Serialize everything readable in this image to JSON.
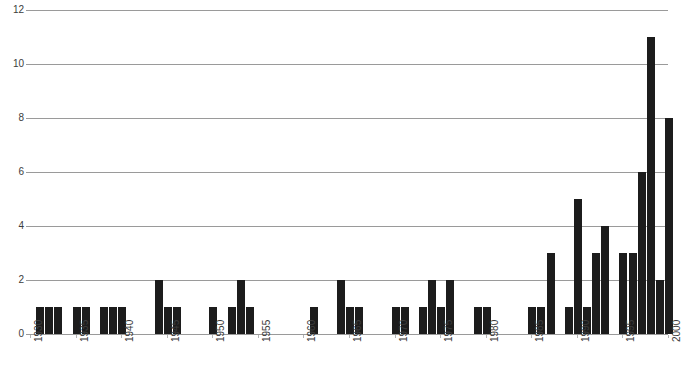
{
  "chart_data": {
    "type": "bar",
    "title": "",
    "subtitle": "",
    "xlabel": "",
    "ylabel": "",
    "grid": true,
    "legend": null,
    "ylim": [
      0,
      12
    ],
    "xlim": [
      1930,
      2000
    ],
    "y_ticks": [
      0,
      2,
      4,
      6,
      8,
      10,
      12
    ],
    "y_tick_labels": [
      "0",
      "2",
      "4",
      "6",
      "8",
      "10",
      "12"
    ],
    "x_ticks": [
      1930,
      1935,
      1940,
      1945,
      1950,
      1955,
      1960,
      1965,
      1970,
      1975,
      1980,
      1985,
      1990,
      1995,
      2000
    ],
    "x_tick_labels": [
      "1930",
      "1935",
      "1940",
      "1945",
      "1950",
      "1955",
      "1960",
      "1965",
      "1970",
      "1975",
      "1980",
      "1985",
      "1990",
      "1995",
      "2000"
    ],
    "bar_color": "#1c1c1c",
    "grid_color": "#9a9a9a",
    "categories": [
      1931,
      1932,
      1933,
      1935,
      1936,
      1938,
      1939,
      1940,
      1944,
      1945,
      1946,
      1950,
      1952,
      1953,
      1954,
      1961,
      1964,
      1965,
      1966,
      1970,
      1971,
      1973,
      1974,
      1975,
      1976,
      1979,
      1980,
      1985,
      1986,
      1987,
      1989,
      1990,
      1991,
      1992,
      1993,
      1995,
      1996,
      1997,
      1998,
      1999,
      2000
    ],
    "values": [
      1,
      1,
      1,
      1,
      1,
      1,
      1,
      1,
      2,
      1,
      1,
      1,
      1,
      2,
      1,
      1,
      2,
      1,
      1,
      1,
      1,
      1,
      2,
      1,
      2,
      1,
      1,
      1,
      1,
      3,
      1,
      5,
      1,
      3,
      4,
      3,
      3,
      6,
      11,
      2,
      8
    ]
  }
}
